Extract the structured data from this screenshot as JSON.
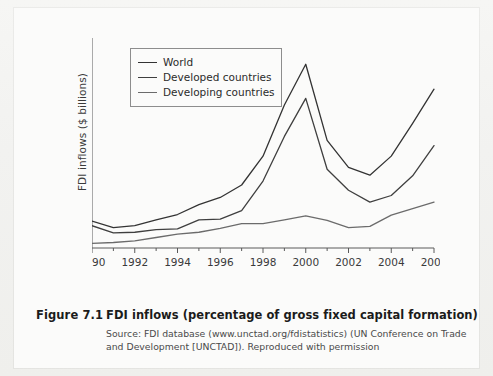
{
  "figure": {
    "caption_number": "Figure 7.1",
    "caption_title": "FDI inflows (percentage of gross fixed capital formation)",
    "source_line1": "Source: FDI database (www.unctad.org/fdistatistics) (UN Conference on Trade and",
    "source_line2": "Development [UNCTAD]). Reproduced with permission"
  },
  "chart_data": {
    "type": "line",
    "title": "",
    "xlabel": "",
    "ylabel": "FDI inflows ($ billions)",
    "x": [
      1990,
      1991,
      1992,
      1993,
      1994,
      1995,
      1996,
      1997,
      1998,
      1999,
      2000,
      2001,
      2002,
      2003,
      2004,
      2005,
      2006
    ],
    "xtick_labels": [
      "1990",
      "1992",
      "1994",
      "1996",
      "1998",
      "2000",
      "2002",
      "2004",
      "2006"
    ],
    "xticks": [
      1990,
      1992,
      1994,
      1996,
      1998,
      2000,
      2002,
      2004,
      2006
    ],
    "xminor_ticks": [
      1991,
      1993,
      1995,
      1997,
      1999,
      2001,
      2003,
      2005
    ],
    "xlim": [
      1990,
      2006
    ],
    "ylim": [
      0,
      1600
    ],
    "yticks": [
      0,
      200,
      400,
      600,
      800,
      1000,
      1200,
      1400,
      1600
    ],
    "ytick_labels": [
      "0",
      "200",
      "400",
      "600",
      "800",
      "1000",
      "1200",
      "1400",
      "1600"
    ],
    "grid": false,
    "legend_position": "upper-left-inside",
    "series": [
      {
        "name": "World",
        "color": "#333333",
        "values": [
          205,
          155,
          170,
          215,
          255,
          330,
          385,
          480,
          700,
          1090,
          1400,
          820,
          615,
          555,
          700,
          950,
          1210
        ]
      },
      {
        "name": "Developed countries",
        "color": "#3f3f3f",
        "values": [
          170,
          115,
          120,
          140,
          145,
          215,
          220,
          285,
          510,
          850,
          1140,
          600,
          440,
          350,
          400,
          550,
          780
        ]
      },
      {
        "name": "Developing countries",
        "color": "#6b6b6b",
        "values": [
          35,
          42,
          55,
          80,
          105,
          120,
          150,
          185,
          185,
          215,
          245,
          210,
          155,
          165,
          250,
          300,
          350
        ]
      }
    ]
  }
}
